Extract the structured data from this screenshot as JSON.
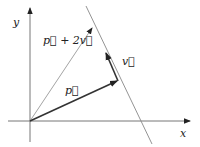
{
  "diagram": {
    "type": "vector-line-diagram",
    "axes": {
      "x_label": "x",
      "y_label": "y"
    },
    "vectors": [
      {
        "name": "p",
        "label": "p⃗",
        "from": [
          30,
          121
        ],
        "to": [
          117,
          81
        ]
      },
      {
        "name": "v",
        "label": "v⃗",
        "from": [
          118,
          81
        ],
        "to": [
          106,
          53
        ]
      },
      {
        "name": "p_plus_2v",
        "label": "p⃗ + 2v⃗",
        "from": [
          30,
          121
        ],
        "to": [
          92,
          28
        ]
      }
    ],
    "line": {
      "from": [
        86,
        8
      ],
      "to": [
        151,
        142
      ]
    },
    "labels": {
      "p": "p⃗",
      "v": "v⃗",
      "p_plus_2v": "p⃗ + 2v⃗",
      "x": "x",
      "y": "y"
    },
    "colors": {
      "axis": "#555555",
      "line": "#777777",
      "vector_p": "#333333",
      "vector_v": "#333333",
      "vector_sum": "#888888"
    }
  }
}
